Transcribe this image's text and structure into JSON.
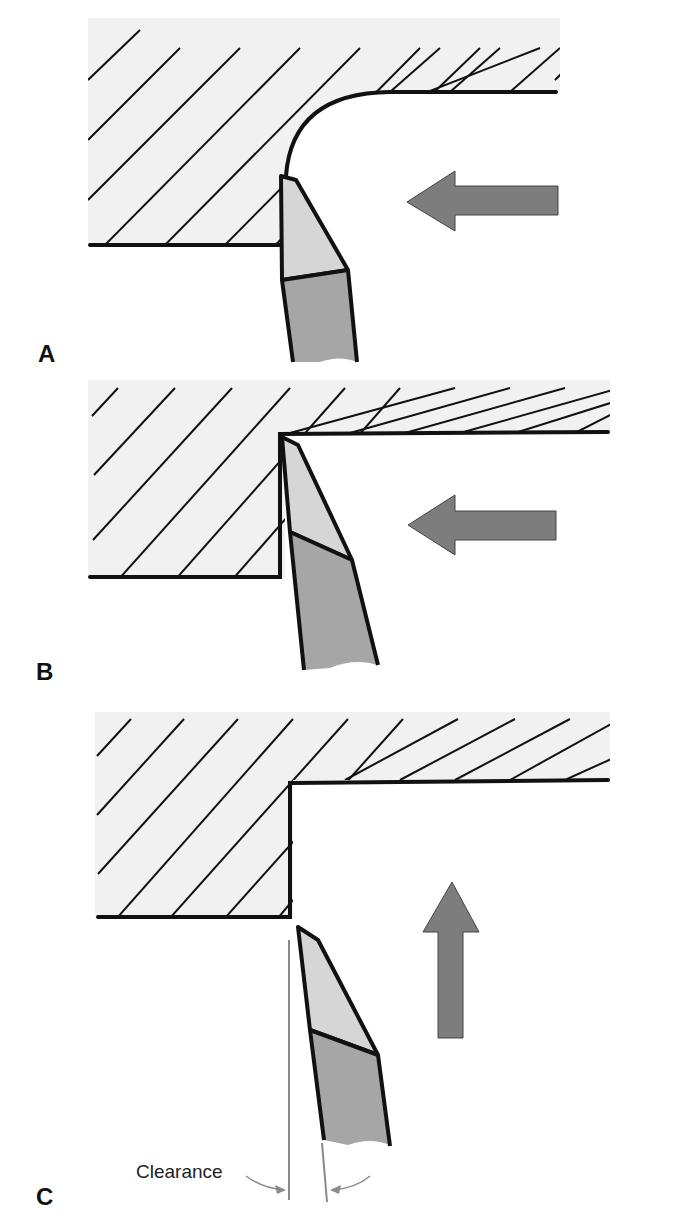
{
  "figure": {
    "panels": [
      {
        "id": "A",
        "label": "A",
        "description": "Tool with nose radius cutting shoulder, feeding left"
      },
      {
        "id": "B",
        "label": "B",
        "description": "Sharp tool cutting square shoulder, feeding left"
      },
      {
        "id": "C",
        "label": "C",
        "description": "Tool withdrawn from square shoulder, feeding up, showing clearance"
      }
    ],
    "annotations": {
      "clearance_label": "Clearance"
    },
    "colors": {
      "workpiece_fill": "#f1f1f1",
      "hatch_stroke": "#111111",
      "outline_stroke": "#111111",
      "tool_tip_fill": "#d6d6d6",
      "tool_shank_fill": "#a6a6a6",
      "arrow_fill": "#7d7d7d",
      "clearance_line": "#8a8a8a"
    }
  }
}
